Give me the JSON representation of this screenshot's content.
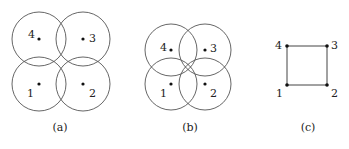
{
  "figure": {
    "panels": [
      {
        "id": "a",
        "caption": "(a)",
        "description": "Four disjoint-ish circles, adjacent circles overlapping pairwise",
        "nodes": [
          {
            "label": "1",
            "x": 39,
            "y": 84
          },
          {
            "label": "2",
            "x": 83,
            "y": 84
          },
          {
            "label": "3",
            "x": 83,
            "y": 39
          },
          {
            "label": "4",
            "x": 39,
            "y": 39
          }
        ],
        "radius": 27
      },
      {
        "id": "b",
        "caption": "(b)",
        "description": "Four circles, all mutually overlapping at center",
        "nodes": [
          {
            "label": "1",
            "x": 171,
            "y": 84
          },
          {
            "label": "2",
            "x": 205,
            "y": 84
          },
          {
            "label": "3",
            "x": 205,
            "y": 50
          },
          {
            "label": "4",
            "x": 171,
            "y": 50
          }
        ],
        "radius": 26
      },
      {
        "id": "c",
        "caption": "(c)",
        "description": "Graph: 4-cycle square 1-2-3-4",
        "nodes": [
          {
            "label": "1",
            "x": 287,
            "y": 85
          },
          {
            "label": "2",
            "x": 327,
            "y": 85
          },
          {
            "label": "3",
            "x": 327,
            "y": 46
          },
          {
            "label": "4",
            "x": 287,
            "y": 46
          }
        ],
        "edges": [
          [
            "1",
            "2"
          ],
          [
            "2",
            "3"
          ],
          [
            "3",
            "4"
          ],
          [
            "4",
            "1"
          ]
        ]
      }
    ]
  }
}
